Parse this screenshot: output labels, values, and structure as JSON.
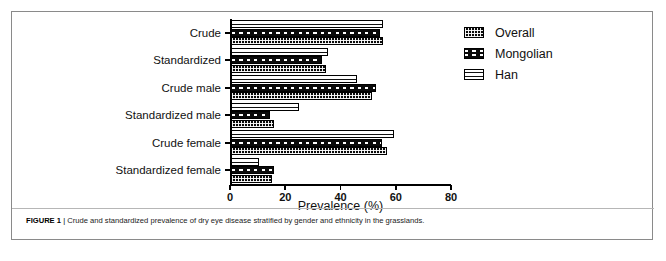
{
  "figure": {
    "caption_label": "FIGURE 1",
    "caption_separator": "|",
    "caption_text": "Crude and standardized prevalence of dry eye disease stratified by gender and ethnicity in the grasslands."
  },
  "legend": {
    "position": "top-right",
    "items": [
      {
        "label": "Overall",
        "pattern": "dark-fine-speckle",
        "swatch_name": "legend-swatch-overall"
      },
      {
        "label": "Mongolian",
        "pattern": "dark-checker",
        "swatch_name": "legend-swatch-mongolian"
      },
      {
        "label": "Han",
        "pattern": "white-horizontal-lines",
        "swatch_name": "legend-swatch-han"
      }
    ]
  },
  "chart_data": {
    "type": "bar",
    "orientation": "horizontal",
    "title": "",
    "xlabel": "Prevalence (%)",
    "ylabel": "",
    "xlim": [
      0,
      80
    ],
    "xticks": [
      0,
      20,
      40,
      60,
      80
    ],
    "xticklabels": [
      "0",
      "20",
      "40",
      "60",
      "80"
    ],
    "grid": false,
    "legend_position": "upper right",
    "categories": [
      "Crude",
      "Standardized",
      "Crude male",
      "Standardized male",
      "Crude female",
      "Standardized female"
    ],
    "series": [
      {
        "name": "Overall",
        "values": [
          55.0,
          34.5,
          51.0,
          15.5,
          56.5,
          15.0
        ]
      },
      {
        "name": "Mongolian",
        "values": [
          54.0,
          33.0,
          52.5,
          14.0,
          54.5,
          15.5
        ]
      },
      {
        "name": "Han",
        "values": [
          55.0,
          35.0,
          45.5,
          24.5,
          59.0,
          10.0
        ]
      }
    ]
  }
}
